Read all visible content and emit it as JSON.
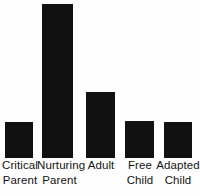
{
  "chart_data": {
    "type": "bar",
    "title": "",
    "subtitle": "",
    "xlabel": "",
    "ylabel": "",
    "grid": false,
    "legend": "none",
    "axis_visible": false,
    "ylim": [
      0,
      160
    ],
    "categories": [
      "Critical\nParent",
      "Nurturing\nParent",
      "Adult",
      "Free\nChild",
      "Adapted\nChild"
    ],
    "values": [
      36,
      154,
      66,
      37,
      36
    ],
    "bar_color": "#111111",
    "background_color": "#fefefe",
    "tick_labels": [],
    "annotations": []
  },
  "bars": [
    {
      "label": "Critical\nParent",
      "value": 36,
      "left": 5,
      "width": 28,
      "height": 36,
      "label_left": 0,
      "label_width": 40
    },
    {
      "label": "Nurturing\nParent",
      "value": 154,
      "left": 42,
      "width": 31,
      "height": 154,
      "label_left": 37,
      "label_width": 45
    },
    {
      "label": "Adult",
      "value": 66,
      "left": 86,
      "width": 29,
      "height": 66,
      "label_left": 82,
      "label_width": 38
    },
    {
      "label": "Free\nChild",
      "value": 37,
      "left": 125,
      "width": 29,
      "height": 37,
      "label_left": 121,
      "label_width": 38
    },
    {
      "label": "Adapted\nChild",
      "value": 36,
      "left": 164,
      "width": 28,
      "height": 36,
      "label_left": 156,
      "label_width": 44
    }
  ]
}
